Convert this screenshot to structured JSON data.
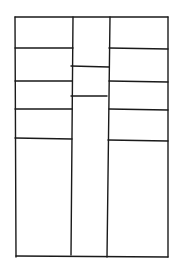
{
  "diagram": {
    "title": "",
    "stroke_color": "#1a1a1a",
    "background": "#ffffff",
    "frame": {
      "x1": 15,
      "y1": 17,
      "x2": 168,
      "y2": 257
    },
    "dividers": [
      {
        "x1": 73,
        "y1": 17,
        "x2": 71,
        "y2": 255
      },
      {
        "x1": 110,
        "y1": 17,
        "x2": 107,
        "y2": 257
      }
    ],
    "shelves": [
      {
        "section": "left",
        "x1": 15,
        "y1": 48,
        "x2": 73,
        "y2": 48
      },
      {
        "section": "left",
        "x1": 15,
        "y1": 81,
        "x2": 72,
        "y2": 81
      },
      {
        "section": "left",
        "x1": 15,
        "y1": 109,
        "x2": 72,
        "y2": 109
      },
      {
        "section": "left",
        "x1": 15,
        "y1": 138,
        "x2": 72,
        "y2": 139
      },
      {
        "section": "center",
        "x1": 71,
        "y1": 66,
        "x2": 109,
        "y2": 67
      },
      {
        "section": "center",
        "x1": 71,
        "y1": 96,
        "x2": 107,
        "y2": 96
      },
      {
        "section": "right",
        "x1": 109,
        "y1": 48,
        "x2": 168,
        "y2": 49
      },
      {
        "section": "right",
        "x1": 109,
        "y1": 81,
        "x2": 168,
        "y2": 82
      },
      {
        "section": "right",
        "x1": 109,
        "y1": 109,
        "x2": 168,
        "y2": 110
      },
      {
        "section": "right",
        "x1": 108,
        "y1": 140,
        "x2": 168,
        "y2": 141
      }
    ]
  }
}
